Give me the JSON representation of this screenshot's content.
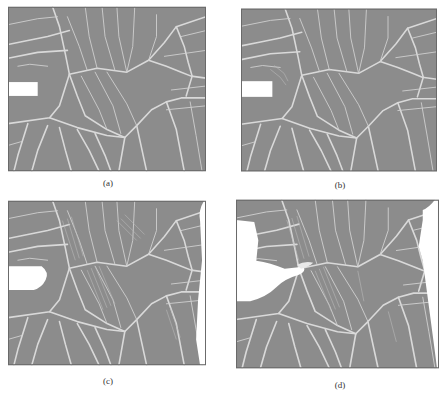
{
  "figure": {
    "colors": {
      "grain_fill": "#8c8c8c",
      "boundary": "#d9d9d9",
      "background": "#ffffff",
      "frame": "#6a6a6a"
    },
    "panels": [
      {
        "id": "a",
        "caption": "(a)"
      },
      {
        "id": "b",
        "caption": "(b)"
      },
      {
        "id": "c",
        "caption": "(c)"
      },
      {
        "id": "d",
        "caption": "(d)"
      }
    ]
  }
}
